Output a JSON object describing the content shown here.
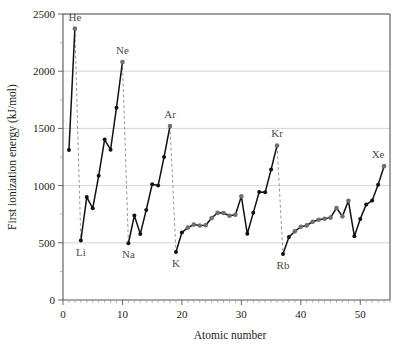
{
  "chart_data": {
    "type": "line",
    "title": "",
    "xlabel": "Atomic number",
    "ylabel": "First ionization energy (kJ/mol)",
    "xlim": [
      0,
      55
    ],
    "ylim": [
      0,
      2500
    ],
    "xticks": [
      0,
      10,
      20,
      30,
      40,
      50
    ],
    "yticks": [
      0,
      500,
      1000,
      1500,
      2000,
      2500
    ],
    "xtick_labels": [
      "0",
      "10",
      "20",
      "30",
      "40",
      "50"
    ],
    "ytick_labels": [
      "0",
      "500",
      "1000",
      "1500",
      "2000",
      "2500"
    ],
    "grid": "horizontal",
    "legend": "none",
    "series": [
      {
        "name": "First ionization energy",
        "x": [
          1,
          2,
          3,
          4,
          5,
          6,
          7,
          8,
          9,
          10,
          11,
          12,
          13,
          14,
          15,
          16,
          17,
          18,
          19,
          20,
          21,
          22,
          23,
          24,
          25,
          26,
          27,
          28,
          29,
          30,
          31,
          32,
          33,
          34,
          35,
          36,
          37,
          38,
          39,
          40,
          41,
          42,
          43,
          44,
          45,
          46,
          47,
          48,
          49,
          50,
          51,
          52,
          53,
          54
        ],
        "values": [
          1312,
          2372,
          520,
          900,
          801,
          1086,
          1402,
          1314,
          1681,
          2081,
          496,
          738,
          578,
          787,
          1012,
          1000,
          1251,
          1521,
          419,
          590,
          633,
          659,
          651,
          653,
          717,
          762,
          760,
          737,
          745,
          906,
          579,
          762,
          944,
          941,
          1140,
          1351,
          403,
          550,
          600,
          640,
          652,
          684,
          702,
          710,
          720,
          804,
          731,
          868,
          558,
          709,
          834,
          869,
          1008,
          1170
        ]
      }
    ],
    "point_labels": [
      {
        "element": "He",
        "x": 2,
        "y": 2372,
        "anchor": "above"
      },
      {
        "element": "Ne",
        "x": 10,
        "y": 2081,
        "anchor": "above"
      },
      {
        "element": "Ar",
        "x": 18,
        "y": 1521,
        "anchor": "above"
      },
      {
        "element": "Kr",
        "x": 36,
        "y": 1351,
        "anchor": "above"
      },
      {
        "element": "Xe",
        "x": 54,
        "y": 1170,
        "anchor": "above"
      },
      {
        "element": "Li",
        "x": 3,
        "y": 520,
        "anchor": "below"
      },
      {
        "element": "Na",
        "x": 11,
        "y": 496,
        "anchor": "below"
      },
      {
        "element": "K",
        "x": 19,
        "y": 419,
        "anchor": "below"
      },
      {
        "element": "Rb",
        "x": 37,
        "y": 403,
        "anchor": "below"
      }
    ],
    "drop_lines": [
      {
        "from_element": "He",
        "to_element": "Li",
        "x_top": 2,
        "y_top": 2372,
        "x_bottom": 3,
        "y_bottom": 520
      },
      {
        "from_element": "Ne",
        "to_element": "Na",
        "x_top": 10,
        "y_top": 2081,
        "x_bottom": 11,
        "y_bottom": 496
      },
      {
        "from_element": "Ar",
        "to_element": "K",
        "x_top": 18,
        "y_top": 1521,
        "x_bottom": 19,
        "y_bottom": 419
      },
      {
        "from_element": "Kr",
        "to_element": "Rb",
        "x_top": 36,
        "y_top": 1351,
        "x_bottom": 37,
        "y_bottom": 403
      }
    ],
    "gray_highlight_x": [
      2,
      10,
      18,
      36,
      54,
      21,
      22,
      23,
      24,
      25,
      26,
      27,
      28,
      29,
      30,
      39,
      40,
      41,
      42,
      43,
      44,
      45,
      46,
      47,
      48
    ]
  },
  "colors": {
    "line": "#111111",
    "marker": "#111111",
    "marker_alt": "#6f6f6f",
    "grid": "#c9c9c9",
    "axis": "#555555",
    "label": "#4a4a4a",
    "background": "#ffffff"
  }
}
